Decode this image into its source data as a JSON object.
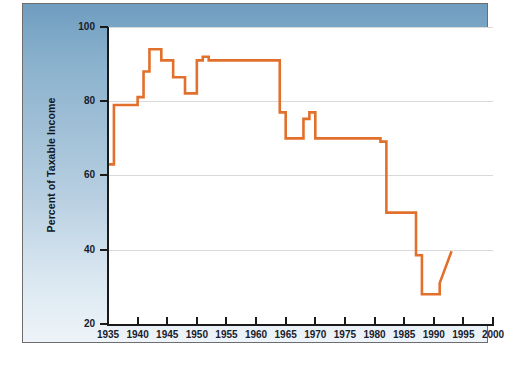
{
  "chart_data": {
    "type": "line",
    "title": "",
    "subtitle": "",
    "xlabel": "",
    "ylabel": "Percent of Taxable Income",
    "xlim": [
      1935,
      2000
    ],
    "ylim": [
      20,
      100
    ],
    "xtick_labels": [
      "1935",
      "1940",
      "1945",
      "1950",
      "1955",
      "1960",
      "1965",
      "1970",
      "1975",
      "1980",
      "1985",
      "1990",
      "1995",
      "2000"
    ],
    "xticks": [
      1935,
      1940,
      1945,
      1950,
      1955,
      1960,
      1965,
      1970,
      1975,
      1980,
      1985,
      1990,
      1995,
      2000
    ],
    "ytick_labels": [
      "20",
      "40",
      "60",
      "80",
      "100"
    ],
    "yticks": [
      20,
      40,
      60,
      80,
      100
    ],
    "grid": "horizontal",
    "legend": "none",
    "line_color": "#e2702c",
    "line_width": 2.6,
    "series": [
      {
        "name": "Top marginal tax rate",
        "x": [
          1935,
          1936,
          1936,
          1940,
          1940,
          1941,
          1941,
          1942,
          1942,
          1944,
          1944,
          1946,
          1946,
          1948,
          1948,
          1950,
          1950,
          1951,
          1951,
          1952,
          1952,
          1964,
          1964,
          1965,
          1965,
          1968,
          1968,
          1969,
          1969,
          1970,
          1970,
          1981,
          1981,
          1982,
          1982,
          1987,
          1987,
          1988,
          1988,
          1991,
          1991,
          1993
        ],
        "y": [
          63,
          63,
          79,
          79,
          81.1,
          81.1,
          88,
          88,
          94,
          94,
          91,
          91,
          86.45,
          86.45,
          82.13,
          82.13,
          91,
          91,
          92,
          92,
          91,
          91,
          77,
          77,
          70,
          70,
          75.25,
          75.25,
          77,
          77,
          70,
          70,
          69.125,
          69.125,
          50,
          50,
          38.5,
          38.5,
          28,
          28,
          31,
          39.6
        ]
      }
    ],
    "annotations": []
  },
  "figure": {
    "background_top_color": "#6f9dc0",
    "background_bottom_color": "#eef4f9",
    "plot_background_color": "#ffffff",
    "gridline_color": "#d9d9d9",
    "axis_color": "#1a1a1a"
  }
}
